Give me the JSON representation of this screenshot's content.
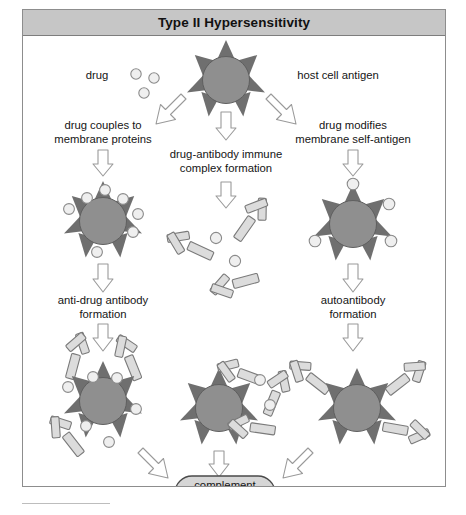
{
  "figure": {
    "title": "Type II Hypersensitivity",
    "domain_kind": "biology-pathway-diagram"
  },
  "labels": {
    "drug": "drug",
    "host_cell_antigen": "host cell antigen",
    "left_step1_line1": "drug couples to",
    "left_step1_line2": "membrane proteins",
    "center_step1_line1": "drug-antibody immune",
    "center_step1_line2": "complex formation",
    "right_step1_line1": "drug modifies",
    "right_step1_line2": "membrane self-antigen",
    "left_step2_line1": "anti-drug antibody",
    "left_step2_line2": "formation",
    "right_step2_line1": "autoantibody",
    "right_step2_line2": "formation",
    "complement_line1": "complement",
    "complement_line2": "activation",
    "outcome": "cell destruction"
  },
  "icons": {
    "cell": "host-cell-icon",
    "drug_molecule": "drug-molecule-icon",
    "antibody": "antibody-icon",
    "arrow_down": "arrow-down-icon",
    "arrow_diagonal": "arrow-diagonal-icon"
  },
  "colors": {
    "title_bar_bg": "#c6c6c6",
    "panel_border": "#8d8d8d",
    "cell_body": "#8f8f8f",
    "cell_spike": "#6f6f6f",
    "drug_fill": "#efefef",
    "drug_stroke": "#8a8a8a",
    "antibody_fill": "#dcdcdc",
    "antibody_stroke": "#7a7a7a",
    "arrow_fill": "#ffffff",
    "arrow_stroke": "#9a9a9a",
    "complement_fill": "#d6d6d6",
    "complement_stroke": "#4a4a4a",
    "text": "#151515"
  },
  "pathways": [
    {
      "name": "left-pathway",
      "steps": [
        "drug couples to membrane proteins",
        "anti-drug antibody formation",
        "complement activation"
      ]
    },
    {
      "name": "center-pathway",
      "steps": [
        "drug-antibody immune complex formation",
        "complement activation"
      ]
    },
    {
      "name": "right-pathway",
      "steps": [
        "drug modifies membrane self-antigen",
        "autoantibody formation",
        "complement activation"
      ]
    }
  ]
}
